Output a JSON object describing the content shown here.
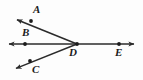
{
  "figure": {
    "type": "geometry-ray-diagram",
    "width": 143,
    "height": 80,
    "background_color": "#fdfdfd",
    "stroke_color": "#2b2b2b",
    "label_color": "#1b1b1b",
    "vertex": {
      "name": "D",
      "x": 77,
      "y": 44
    },
    "points": [
      {
        "label": "A",
        "dot_x": 31,
        "dot_y": 21,
        "label_x": 33,
        "label_y": 4
      },
      {
        "label": "B",
        "dot_x": 25,
        "dot_y": 44,
        "label_x": 22,
        "label_y": 27
      },
      {
        "label": "C",
        "dot_x": 30,
        "dot_y": 61,
        "label_x": 32,
        "label_y": 64
      },
      {
        "label": "D",
        "dot_x": 77,
        "dot_y": 44,
        "label_x": 69,
        "label_y": 47
      },
      {
        "label": "E",
        "dot_x": 119,
        "dot_y": 44,
        "label_x": 115,
        "label_y": 47
      }
    ],
    "rays": [
      {
        "name": "ray-DA",
        "through": "A",
        "from_x": 77,
        "from_y": 44,
        "to_x": 13,
        "to_y": 18,
        "arrow": "end"
      },
      {
        "name": "ray-DB",
        "through": "B",
        "from_x": 77,
        "from_y": 44,
        "to_x": 5,
        "to_y": 44,
        "arrow": "end"
      },
      {
        "name": "ray-DC",
        "through": "C",
        "from_x": 77,
        "from_y": 44,
        "to_x": 12,
        "to_y": 70,
        "arrow": "end"
      },
      {
        "name": "ray-DE",
        "through": "E",
        "from_x": 77,
        "from_y": 44,
        "to_x": 138,
        "to_y": 44,
        "arrow": "end"
      }
    ]
  }
}
